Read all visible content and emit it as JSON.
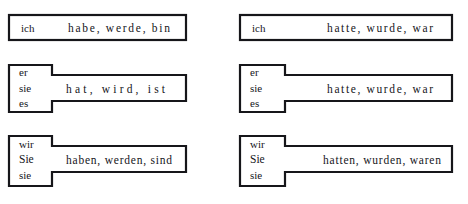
{
  "page": {
    "background_color": "#ffffff",
    "ink_color": "#16161a"
  },
  "columns": [
    {
      "name": "present-tense-column",
      "rows": [
        {
          "id": "left-row-1",
          "shape": "plain-rectangle",
          "pronouns": [
            "ich"
          ],
          "verbs": "habe, werde, bin",
          "verb_parts": [
            "habe,",
            "werde,",
            "bin"
          ]
        },
        {
          "id": "left-row-2",
          "shape": "stepped-rectangle",
          "pronouns": [
            "er",
            "sie",
            "es"
          ],
          "verbs": "hat, wird, ist",
          "verb_parts": [
            "hat,",
            "wird,",
            "ist"
          ]
        },
        {
          "id": "left-row-3",
          "shape": "stepped-rectangle",
          "pronouns": [
            "wir",
            "Sie",
            "sie"
          ],
          "verbs": "haben, werden, sind",
          "verb_parts": [
            "haben,",
            "werden,",
            "sind"
          ]
        }
      ]
    },
    {
      "name": "past-tense-column",
      "rows": [
        {
          "id": "right-row-1",
          "shape": "plain-rectangle",
          "pronouns": [
            "ich"
          ],
          "verbs": "hatte, wurde, war",
          "verb_parts": [
            "hatte,",
            "wurde,",
            "war"
          ]
        },
        {
          "id": "right-row-2",
          "shape": "stepped-rectangle",
          "pronouns": [
            "er",
            "sie",
            "es"
          ],
          "verbs": "hatte, wurde, war",
          "verb_parts": [
            "hatte,",
            "wurde,",
            "war"
          ]
        },
        {
          "id": "right-row-3",
          "shape": "stepped-rectangle",
          "pronouns": [
            "wir",
            "Sie",
            "sie"
          ],
          "verbs": "hatten, wurden, waren",
          "verb_parts": [
            "hatten,",
            "wurden,",
            "waren"
          ]
        }
      ]
    }
  ]
}
